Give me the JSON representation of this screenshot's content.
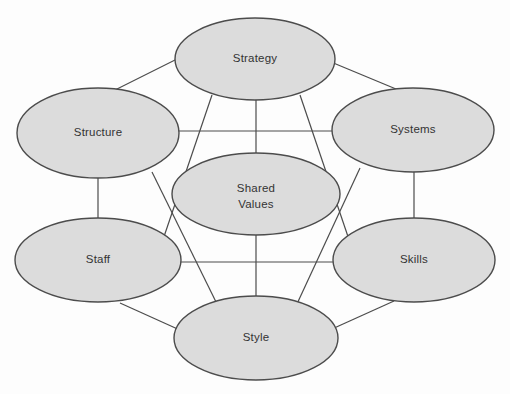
{
  "diagram": {
    "type": "network-diagram",
    "background_color": "#fdfdfd",
    "node_fill_color": "#dcdcdc",
    "node_stroke_color": "#4c4c4c",
    "link_color": "#4c4c4c",
    "label_color": "#333333",
    "nodes": [
      {
        "id": "strategy",
        "label": "Strategy",
        "label_line1": "Strategy",
        "label_line2": "",
        "cx": 255,
        "cy": 59,
        "rx": 80,
        "ry": 41,
        "role": "hard-element"
      },
      {
        "id": "structure",
        "label": "Structure",
        "label_line1": "Structure",
        "label_line2": "",
        "cx": 98,
        "cy": 133,
        "rx": 81,
        "ry": 45,
        "role": "hard-element"
      },
      {
        "id": "systems",
        "label": "Systems",
        "label_line1": "Systems",
        "label_line2": "",
        "cx": 413,
        "cy": 130,
        "rx": 81,
        "ry": 42,
        "role": "hard-element"
      },
      {
        "id": "shared-values",
        "label": "Shared Values",
        "label_line1": "Shared",
        "label_line2": "Values",
        "cx": 256,
        "cy": 194,
        "rx": 84,
        "ry": 41,
        "role": "core-element"
      },
      {
        "id": "staff",
        "label": "Staff",
        "label_line1": "Staff",
        "label_line2": "",
        "cx": 98,
        "cy": 260,
        "rx": 83,
        "ry": 42,
        "role": "soft-element"
      },
      {
        "id": "skills",
        "label": "Skills",
        "label_line1": "Skills",
        "label_line2": "",
        "cx": 414,
        "cy": 260,
        "rx": 81,
        "ry": 42,
        "role": "soft-element"
      },
      {
        "id": "style",
        "label": "Style",
        "label_line1": "Style",
        "label_line2": "",
        "cx": 256,
        "cy": 338,
        "rx": 82,
        "ry": 42,
        "role": "soft-element"
      }
    ],
    "links": [
      {
        "id": "structure-strategy",
        "from": "structure",
        "to": "strategy",
        "x1": 115,
        "y1": 90,
        "x2": 181,
        "y2": 57,
        "kind": "diagonal"
      },
      {
        "id": "strategy-systems",
        "from": "strategy",
        "to": "systems",
        "x1": 331,
        "y1": 62,
        "x2": 396,
        "y2": 89,
        "kind": "diagonal"
      },
      {
        "id": "structure-systems",
        "from": "structure",
        "to": "systems",
        "x1": 178,
        "y1": 131,
        "x2": 333,
        "y2": 131,
        "kind": "horizontal"
      },
      {
        "id": "strategy-shared-values",
        "from": "strategy",
        "to": "shared-values",
        "x1": 256,
        "y1": 100,
        "x2": 256,
        "y2": 153,
        "kind": "vertical"
      },
      {
        "id": "structure-staff",
        "from": "structure",
        "to": "staff",
        "x1": 98,
        "y1": 178,
        "x2": 98,
        "y2": 218,
        "kind": "vertical"
      },
      {
        "id": "systems-skills",
        "from": "systems",
        "to": "skills",
        "x1": 414,
        "y1": 172,
        "x2": 414,
        "y2": 218,
        "kind": "vertical"
      },
      {
        "id": "strategy-style",
        "from": "strategy",
        "to": "style",
        "x1": 212,
        "y1": 95,
        "x2": 152,
        "y2": 272,
        "kind": "diagonal-long"
      },
      {
        "id": "strategy-skills",
        "from": "strategy",
        "to": "skills",
        "x1": 300,
        "y1": 95,
        "x2": 360,
        "y2": 272,
        "kind": "diagonal-long"
      },
      {
        "id": "structure-style",
        "from": "structure",
        "to": "style",
        "x1": 152,
        "y1": 172,
        "x2": 218,
        "y2": 306,
        "kind": "diagonal-long"
      },
      {
        "id": "systems-style",
        "from": "systems",
        "to": "style",
        "x1": 360,
        "y1": 168,
        "x2": 296,
        "y2": 306,
        "kind": "diagonal-long"
      },
      {
        "id": "staff-skills",
        "from": "staff",
        "to": "skills",
        "x1": 180,
        "y1": 262,
        "x2": 334,
        "y2": 262,
        "kind": "horizontal"
      },
      {
        "id": "shared-values-style",
        "from": "shared-values",
        "to": "style",
        "x1": 256,
        "y1": 235,
        "x2": 256,
        "y2": 297,
        "kind": "vertical"
      },
      {
        "id": "staff-style",
        "from": "staff",
        "to": "style",
        "x1": 120,
        "y1": 303,
        "x2": 182,
        "y2": 331,
        "kind": "diagonal"
      },
      {
        "id": "style-skills",
        "from": "style",
        "to": "skills",
        "x1": 332,
        "y1": 329,
        "x2": 394,
        "y2": 301,
        "kind": "diagonal"
      }
    ]
  }
}
